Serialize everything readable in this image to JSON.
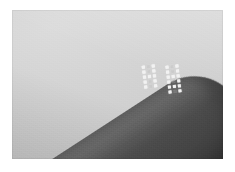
{
  "image": {
    "kind": "photograph",
    "mode": "grayscale",
    "caption": "Close-up grayscale photograph of a fingertip with two small arrays of bright dots on its surface",
    "width_px": 235,
    "height_px": 172,
    "plate": {
      "left_px": 12,
      "top_px": 10,
      "width_px": 211,
      "height_px": 149,
      "margin_color": "#ffffff"
    }
  },
  "palette": {
    "paper_white": "#ffffff",
    "background_light": "#d4d4d4",
    "background_highlight": "#dcdcdc",
    "background_shadow": "#cbcbcb",
    "subject_light": "#5d5d5d",
    "subject_mid": "#4c4c4c",
    "subject_dark": "#3a3a3a",
    "marker_bright": "#f2f2f2",
    "marker_dim": "#b9b9b9"
  },
  "subject": {
    "name": "fingertip",
    "description": "Dark rounded elongated form entering from the lower-left corner, tip pointing to the upper-right",
    "orientation_deg": -33,
    "tip_position": {
      "x_px": 190,
      "y_px": 52
    },
    "tone": "dark gray"
  },
  "markers": {
    "description": "Two rectangular clusters of small bright dots applied to the subject surface",
    "cluster_count": 2,
    "clusters": [
      {
        "id": "dot-array-left",
        "label": "left dot array",
        "columns": 3,
        "rows": 5,
        "origin": {
          "x_px": 131,
          "y_px": 55
        },
        "dot_size_px": 3,
        "gap_px": 2,
        "rotation_deg": -7,
        "pattern": [
          [
            1,
            0,
            1
          ],
          [
            1,
            0,
            1
          ],
          [
            1,
            1,
            1
          ],
          [
            1,
            0,
            1
          ],
          [
            1,
            0,
            1
          ]
        ]
      },
      {
        "id": "dot-array-right",
        "label": "right dot array",
        "columns": 3,
        "rows": 6,
        "origin": {
          "x_px": 155,
          "y_px": 55
        },
        "dot_size_px": 3,
        "gap_px": 2,
        "rotation_deg": -7,
        "pattern": [
          [
            1,
            0,
            1
          ],
          [
            1,
            0,
            1
          ],
          [
            1,
            1,
            1
          ],
          [
            1,
            0,
            1
          ],
          [
            1,
            1,
            1
          ],
          [
            1,
            0,
            1
          ]
        ]
      }
    ]
  }
}
